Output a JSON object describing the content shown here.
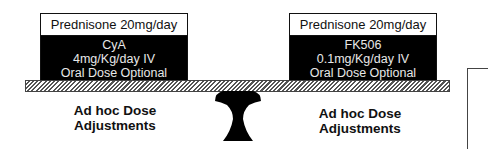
{
  "diagram": {
    "left_weight": {
      "header": "Prednisone 20mg/day",
      "lines": [
        "CyA",
        "4mg/Kg/day IV",
        "Oral Dose Optional"
      ]
    },
    "right_weight": {
      "header": "Prednisone 20mg/day",
      "lines": [
        "FK506",
        "0.1mg/Kg/day IV",
        "Oral Dose Optional"
      ]
    },
    "left_caption": [
      "Ad hoc Dose",
      "Adjustments"
    ],
    "right_caption": [
      "Ad hoc Dose",
      "Adjustments"
    ],
    "colors": {
      "box_fill": "#000000",
      "text_light": "#e8e8e8",
      "ink": "#111111"
    }
  }
}
